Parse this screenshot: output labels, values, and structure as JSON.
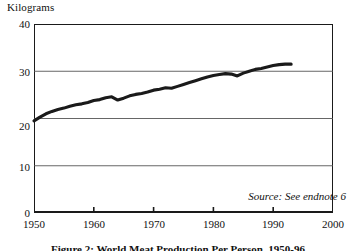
{
  "figure": {
    "y_axis_unit": "Kilograms",
    "source_note": "Source: See endnote 6",
    "caption": "Figure 2: World Meat Production Per Person, 1950-96"
  },
  "chart_data": {
    "type": "line",
    "title": "",
    "subtitle": "",
    "xlabel": "",
    "ylabel": "Kilograms",
    "grid": true,
    "legend": "none",
    "annotations": [
      "Source: See endnote 6"
    ],
    "xlim": [
      1950,
      2000
    ],
    "ylim": [
      0,
      40
    ],
    "xticks": [
      1950,
      1960,
      1970,
      1980,
      1990,
      2000
    ],
    "yticks": [
      0,
      10,
      20,
      30,
      40
    ],
    "line_color": "#1a1a1a",
    "series": [
      {
        "name": "World meat production per person",
        "units": "kilograms",
        "x": [
          1950,
          1951,
          1952,
          1953,
          1954,
          1955,
          1956,
          1957,
          1958,
          1959,
          1960,
          1961,
          1962,
          1963,
          1964,
          1965,
          1966,
          1967,
          1968,
          1969,
          1970,
          1971,
          1972,
          1973,
          1974,
          1975,
          1976,
          1977,
          1978,
          1979,
          1980,
          1981,
          1982,
          1983,
          1984,
          1985,
          1986,
          1987,
          1988,
          1989,
          1990,
          1991,
          1992,
          1993
        ],
        "values": [
          19.5,
          20.3,
          21.0,
          21.5,
          21.9,
          22.2,
          22.6,
          22.9,
          23.1,
          23.4,
          23.8,
          24.0,
          24.4,
          24.6,
          23.9,
          24.3,
          24.8,
          25.1,
          25.3,
          25.6,
          26.0,
          26.2,
          26.5,
          26.4,
          26.8,
          27.2,
          27.6,
          28.0,
          28.4,
          28.8,
          29.1,
          29.3,
          29.5,
          29.4,
          29.0,
          29.6,
          30.0,
          30.4,
          30.6,
          30.9,
          31.2,
          31.4,
          31.5,
          31.5
        ]
      }
    ]
  }
}
